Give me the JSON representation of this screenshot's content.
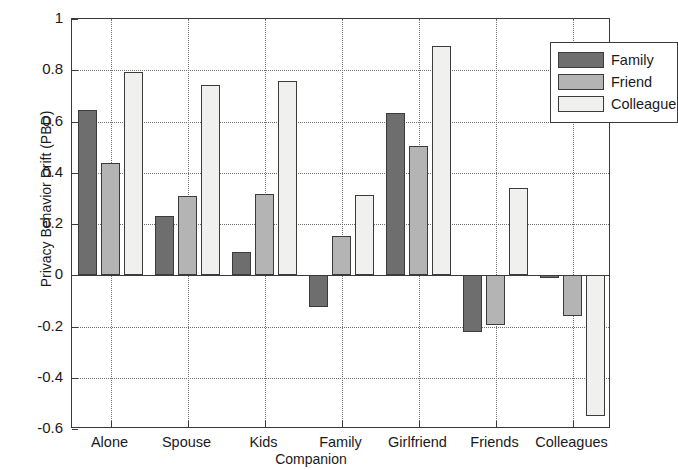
{
  "chart_data": {
    "type": "bar",
    "title": "",
    "xlabel": "Companion",
    "ylabel": "Privacy Behavior Drift (PBD)",
    "categories": [
      "Alone",
      "Spouse",
      "Kids",
      "Family",
      "Girlfriend",
      "Friends",
      "Colleagues"
    ],
    "series": [
      {
        "name": "Family",
        "color": "#6e6e6e",
        "values": [
          0.645,
          0.232,
          0.09,
          -0.123,
          0.635,
          -0.22,
          -0.01
        ]
      },
      {
        "name": "Friend",
        "color": "#b4b4b4",
        "values": [
          0.438,
          0.308,
          0.318,
          0.152,
          0.505,
          -0.196,
          -0.158
        ]
      },
      {
        "name": "Colleague",
        "color": "#f0f0ee",
        "values": [
          0.793,
          0.743,
          0.76,
          0.312,
          0.895,
          0.342,
          -0.55
        ]
      }
    ],
    "ylim": [
      -0.6,
      1
    ],
    "yticks": [
      1,
      0.8,
      0.6,
      0.4,
      0.2,
      0,
      -0.2,
      -0.4,
      -0.6
    ],
    "ytick_labels": [
      "1",
      "0.8",
      "0.6",
      "0.4",
      "0.2",
      "0",
      "-0.2",
      "-0.4",
      "-0.6"
    ],
    "grid": "dotted",
    "legend_position": "top-right",
    "bar_edge_color": "#3b3b3b",
    "axis_color": "#3a3a3a"
  },
  "legend": {
    "entries": [
      {
        "label": "Family"
      },
      {
        "label": "Friend"
      },
      {
        "label": "Colleague"
      }
    ]
  },
  "axes": {
    "y_title": "Privacy Behavior Drift (PBD)",
    "x_title": "Companion"
  }
}
